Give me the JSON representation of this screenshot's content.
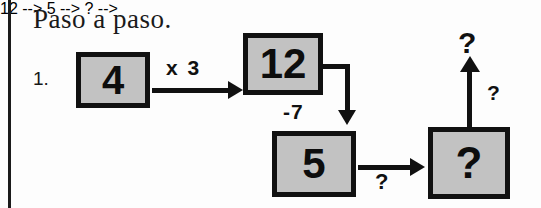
{
  "page": {
    "heading": "Paso a paso.",
    "item_number": "1.",
    "ink_color": "#111111",
    "box_fill_color": "#c2c2c2",
    "background_color": "#fdfdfd"
  },
  "flow": {
    "boxes": [
      {
        "id": "start",
        "value": "4"
      },
      {
        "id": "after-times",
        "value": "12"
      },
      {
        "id": "after-minus",
        "value": "5"
      },
      {
        "id": "result",
        "value": "?"
      }
    ],
    "operations": [
      {
        "id": "multiply",
        "label": "x 3",
        "direction": "right"
      },
      {
        "id": "subtract",
        "label": "-7",
        "direction": "down"
      },
      {
        "id": "unknown-1",
        "label": "?",
        "direction": "right"
      },
      {
        "id": "unknown-2",
        "label": "?",
        "direction": "up"
      }
    ],
    "output_label": "?"
  }
}
